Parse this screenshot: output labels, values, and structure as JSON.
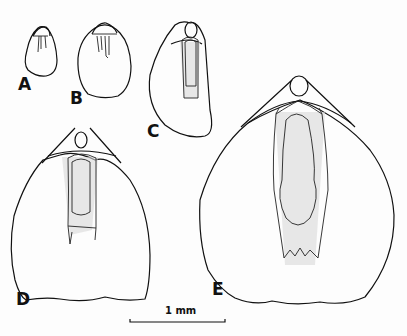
{
  "figure": {
    "panels": [
      {
        "id": "A",
        "label": "A"
      },
      {
        "id": "B",
        "label": "B"
      },
      {
        "id": "C",
        "label": "C"
      },
      {
        "id": "D",
        "label": "D"
      },
      {
        "id": "E",
        "label": "E"
      }
    ],
    "scale_bar": {
      "label": "1 mm"
    },
    "colors": {
      "line": "#111111",
      "background": "#fdfdfd",
      "stipple": "#d8d8d8"
    }
  }
}
